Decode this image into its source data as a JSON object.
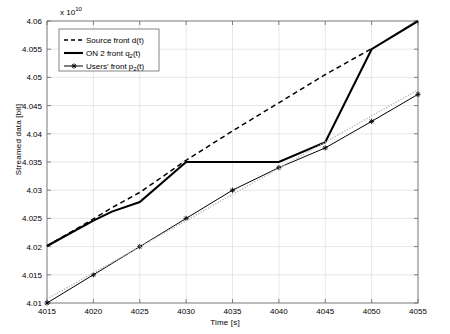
{
  "chart_data": {
    "type": "line",
    "title": "",
    "xlabel": "Time [s]",
    "ylabel": "Streamed data [bit]",
    "y_multiplier": "x 10",
    "y_multiplier_exponent": "10",
    "xlim": [
      4015,
      4055
    ],
    "ylim": [
      4.01,
      4.06
    ],
    "xticks": [
      4015,
      4020,
      4025,
      4030,
      4035,
      4040,
      4045,
      4050,
      4055
    ],
    "xticklabels": [
      "4015",
      "4020",
      "4025",
      "4030",
      "4035",
      "4040",
      "4045",
      "4050",
      "4055"
    ],
    "yticks": [
      4.01,
      4.015,
      4.02,
      4.025,
      4.03,
      4.035,
      4.04,
      4.045,
      4.05,
      4.055,
      4.06
    ],
    "yticklabels": [
      "4.01",
      "4.015",
      "4.02",
      "4.025",
      "4.03",
      "4.035",
      "4.04",
      "4.045",
      "4.05",
      "4.055",
      "4.06"
    ],
    "grid": true,
    "legend_position": "upper-left",
    "series": [
      {
        "name": "source-front",
        "label": "Source front d(t)",
        "style": "dashed",
        "color": "#000000",
        "marker": "none",
        "x": [
          4015,
          4020,
          4022,
          4025,
          4030,
          4035,
          4040,
          4045,
          4050
        ],
        "y": [
          4.0201,
          4.0249,
          4.0269,
          4.0296,
          4.0353,
          4.0405,
          4.0455,
          4.0505,
          4.0551
        ]
      },
      {
        "name": "on2-front",
        "label": "ON 2 front q₂(t)",
        "style": "solid-thick",
        "color": "#000000",
        "marker": "none",
        "x": [
          4015,
          4020,
          4022,
          4025,
          4030,
          4035,
          4040,
          4045,
          4050,
          4055
        ],
        "y": [
          4.0201,
          4.0246,
          4.0262,
          4.0279,
          4.035,
          4.035,
          4.035,
          4.0385,
          4.055,
          4.06
        ]
      },
      {
        "name": "users-front",
        "label": "Users' front p₂(t)",
        "style": "solid-marker",
        "color": "#000000",
        "marker": "star",
        "x": [
          4015,
          4020,
          4025,
          4030,
          4035,
          4040,
          4045,
          4050,
          4055
        ],
        "y": [
          4.01,
          4.015,
          4.02,
          4.025,
          4.03,
          4.034,
          4.0375,
          4.0422,
          4.047
        ]
      },
      {
        "name": "users-front-reference",
        "label": "",
        "style": "dotted-light",
        "color": "#b4b4b4",
        "marker": "none",
        "x": [
          4015,
          4055
        ],
        "y": [
          4.0107,
          4.0478
        ]
      }
    ],
    "legend": [
      {
        "label": "Source front d(t)",
        "style": "dashed"
      },
      {
        "label": "ON 2 front q₂(t)",
        "style": "solid-thick"
      },
      {
        "label": "Users' front p₂(t)",
        "style": "solid-marker"
      }
    ]
  }
}
